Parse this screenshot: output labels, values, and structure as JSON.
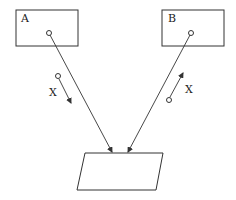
{
  "diagram": {
    "boxes": [
      {
        "id": "A",
        "label": "A"
      },
      {
        "id": "B",
        "label": "B"
      }
    ],
    "motion_labels": [
      {
        "side": "left",
        "label": "X"
      },
      {
        "side": "right",
        "label": "X"
      }
    ],
    "target": {
      "shape": "parallelogram"
    },
    "colors": {
      "stroke": "#333333",
      "background": "#ffffff"
    }
  }
}
